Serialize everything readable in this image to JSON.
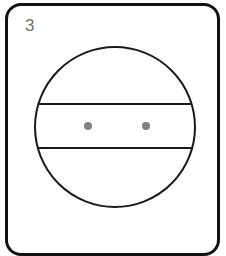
{
  "card": {
    "index_label": "3",
    "index_color": "#6f6f6f",
    "border_color": "#111111",
    "background_color": "#ffffff",
    "corner_radius_px": 16,
    "border_width_px": 3
  },
  "figure": {
    "name": "circle-with-horizontal-band-and-two-dots",
    "stroke_color": "#1a1a1a",
    "fill_color": "#ffffff",
    "circle": {
      "center_x": 115,
      "center_y": 127,
      "radius": 80,
      "stroke_width": 2
    },
    "chords": [
      {
        "label": "upper-chord",
        "y": 104,
        "stroke_width": 2
      },
      {
        "label": "lower-chord",
        "y": 148,
        "stroke_width": 2
      }
    ],
    "dots": [
      {
        "label": "left-dot",
        "cx": 88,
        "cy": 126,
        "r": 4,
        "color": "#808080"
      },
      {
        "label": "right-dot",
        "cx": 146,
        "cy": 126,
        "r": 4,
        "color": "#808080"
      }
    ]
  }
}
